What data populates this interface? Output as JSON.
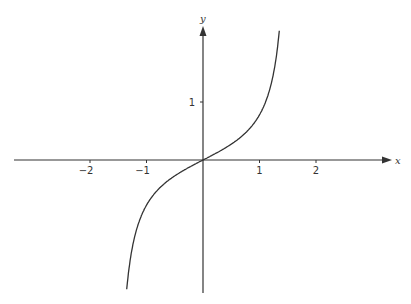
{
  "chart_data": {
    "type": "line",
    "title": "",
    "xlabel": "x",
    "ylabel": "y",
    "xlim": [
      -3.3,
      3.3
    ],
    "ylim": [
      -2.3,
      2.3
    ],
    "grid": false,
    "legend": null,
    "x_ticks": [
      -2,
      -1,
      1,
      2
    ],
    "x_tick_labels": [
      "−2",
      "−1",
      "1",
      "2"
    ],
    "y_ticks": [
      1
    ],
    "y_tick_labels": [
      "1"
    ],
    "series": [
      {
        "name": "curve",
        "description": "odd, increasing curve through origin, approximately y = tan(x)/2",
        "x": [
          -1.35,
          -1.3,
          -1.2,
          -1.0,
          -0.8,
          -0.6,
          -0.4,
          -0.2,
          0,
          0.2,
          0.4,
          0.6,
          0.8,
          1.0,
          1.2,
          1.3,
          1.35
        ],
        "y": [
          -2.22,
          -1.8,
          -1.29,
          -0.78,
          -0.51,
          -0.34,
          -0.21,
          -0.1,
          0,
          0.1,
          0.21,
          0.34,
          0.51,
          0.78,
          1.29,
          1.8,
          2.22
        ],
        "color": "#333333"
      }
    ]
  },
  "axes": {
    "x_label": "x",
    "y_label": "y",
    "color": "#333333"
  }
}
